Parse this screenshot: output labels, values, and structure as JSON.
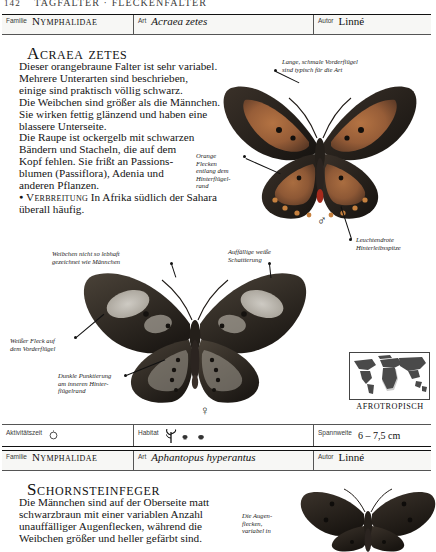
{
  "running_head": {
    "page_number": "142",
    "text": "TAGFALTER · FLECKENFALTER"
  },
  "labels": {
    "familie": "Familie",
    "art": "Art",
    "autor": "Autor",
    "aktivitaetszeit": "Aktivitätszeit",
    "habitat": "Habitat",
    "spannweite": "Spannweite"
  },
  "entries": [
    {
      "familie": "Nymphalidae",
      "art": "Acraea zetes",
      "autor": "Linné",
      "headline": "Acraea zetes",
      "body": [
        "Dieser orangebraune Falter ist sehr variabel.",
        "Mehrere Unterarten sind beschrieben,",
        "einige sind praktisch völlig schwarz.",
        "Die Weibchen sind größer als die Männchen.",
        "Sie wirken fettig glänzend und haben eine",
        "blassere Unterseite.",
        "Die Raupe ist ockergelb mit schwarzen",
        "Bändern und Stacheln, die auf dem",
        "Kopf fehlen. Sie frißt an Passions-",
        "blumen (Passiflora), Adenia und",
        "anderen Pflanzen."
      ],
      "distribution_lead": "Verbreitung",
      "distribution_text": "In Afrika südlich der Sahara überall häufig.",
      "callouts": [
        {
          "name": "forewing-shape",
          "text": "Lange, schmale Vorderflügel\nsind typisch für die Art"
        },
        {
          "name": "orange-spots",
          "text": "Orange\nFlecken\nentlang dem\nHinterflügel-\nrand"
        },
        {
          "name": "red-abdomen-tip",
          "text": "Leuchtendrote\nHinterleibsspitze"
        },
        {
          "name": "female-markings",
          "text": "Weibchen nicht so lebhaft\ngezeichnet wie Männchen"
        },
        {
          "name": "white-shading",
          "text": "Auffällige weiße\nSchattierung"
        },
        {
          "name": "white-forewing-patch",
          "text": "Weißer Fleck auf\ndem Vorderflügel"
        },
        {
          "name": "dark-dotting",
          "text": "Dunkle Punktierung\nam inneren Hinter-\nflügelrand"
        }
      ],
      "sex_male": "♂",
      "sex_female": "♀",
      "map_label": "AFROTROPISCH",
      "data": {
        "aktivitaetszeit_icon": "sun-icon",
        "habitat_icons": [
          "grass-tuft-icon",
          "shrub-icon",
          "shrub-icon"
        ],
        "spannweite": "6 – 7,5 cm"
      }
    },
    {
      "familie": "Nymphalidae",
      "art": "Aphantopus hyperantus",
      "autor": "Linné",
      "headline": "Schornsteinfeger",
      "body": [
        "Die Männchen sind auf der Oberseite matt",
        "schwarzbraun mit einer variablen Anzahl",
        "unauffälliger Augenflecken, während die",
        "Weibchen größer und heller gefärbt sind."
      ],
      "callouts": [
        {
          "name": "eyespots",
          "text": "Die Augen-\nflecken,\nvariabel in"
        }
      ]
    }
  ],
  "colors": {
    "rule": "#111111",
    "text": "#141414",
    "bar_bg": "#f7f7f5",
    "wing_orange": "#b5683a",
    "wing_dark": "#2b2722",
    "map_land": "#4a4a4a",
    "map_range": "#c9c9c9"
  }
}
